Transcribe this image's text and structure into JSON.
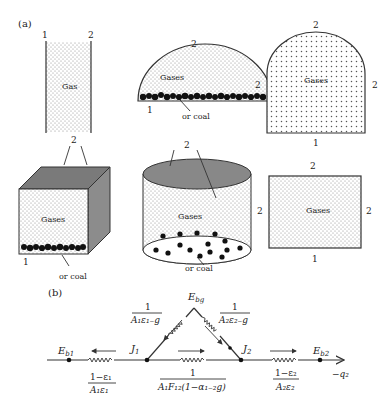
{
  "figure": {
    "panel_a_label": "(a)",
    "panel_b_label": "(b)",
    "panel_a": {
      "slab": {
        "gas_label": "Gas",
        "left_surface": "1",
        "right_surface": "2"
      },
      "half_cylinder": {
        "gas_label": "Gases",
        "top_surface": "2",
        "bottom_surface": "1",
        "coal_label": "or coal"
      },
      "arch": {
        "gas_label": "Gases",
        "top_surface": "2",
        "left_surface": "2",
        "right_surface": "2",
        "bottom_surface": "1"
      },
      "cube": {
        "gas_label": "Gases",
        "top_surface": "2",
        "bottom_surface": "1",
        "coal_label": "or coal"
      },
      "cylinder": {
        "gas_label": "Gases",
        "top_surface": "2",
        "coal_label": "or coal"
      },
      "rectangle": {
        "gas_label": "Gases",
        "top_surface": "2",
        "left_surface": "2",
        "right_surface": "2",
        "bottom_surface": "1"
      }
    },
    "panel_b": {
      "nodes": {
        "eb1": {
          "main": "E",
          "sub": "b1"
        },
        "j1": {
          "main": "J",
          "sub": "1"
        },
        "j2": {
          "main": "J",
          "sub": "2"
        },
        "eb2": {
          "main": "E",
          "sub": "b2"
        },
        "ebg": {
          "main": "E",
          "sub": "bg"
        }
      },
      "resistances": {
        "r1": {
          "numerator": "1−ε₁",
          "denominator": "A₁ε₁"
        },
        "r1g": {
          "numerator": "1",
          "denominator": "A₁ε₁₋g"
        },
        "r2g": {
          "numerator": "1",
          "denominator": "A₂ε₂₋g"
        },
        "r12": {
          "numerator": "1",
          "denominator": "A₁F₁₂(1−α₁₋₂g)"
        },
        "r2": {
          "numerator": "1−ε₂",
          "denominator": "A₂ε₂"
        }
      },
      "heat_flow_label": "−q₂"
    }
  }
}
